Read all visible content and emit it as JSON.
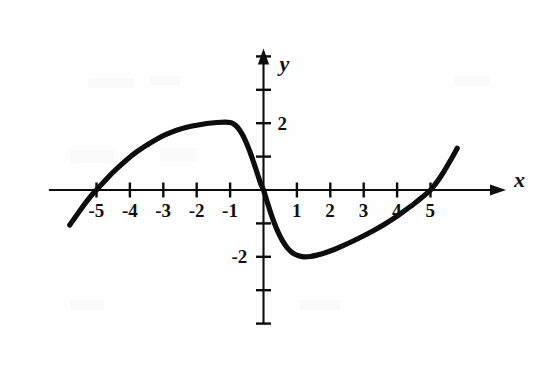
{
  "figure": {
    "background_color": "#fefefe",
    "ink_color": "#0d0d0d",
    "x_axis_label": "x",
    "y_axis_label": "y"
  },
  "chart_data": {
    "type": "line",
    "title": "",
    "subtitle": "",
    "xlabel": "x",
    "ylabel": "y",
    "xlim": [
      -6.1,
      7.2
    ],
    "ylim": [
      -4.1,
      4.3
    ],
    "grid": false,
    "legend": null,
    "axis_arrows": [
      "x-positive",
      "y-positive"
    ],
    "xticks": [
      -5,
      -4,
      -3,
      -2,
      -1,
      1,
      2,
      3,
      4,
      5
    ],
    "xtick_labels": [
      "-5",
      "-4",
      "-3",
      "-2",
      "-1",
      "1",
      "2",
      "3",
      "4",
      "5"
    ],
    "yticks": [
      -4,
      -3,
      -2,
      -1,
      1,
      2,
      3,
      4
    ],
    "ytick_labels": [
      "",
      "",
      "-2",
      "",
      "",
      "2",
      "",
      ""
    ],
    "labeled_yticks": [
      {
        "value": 2,
        "label": "2",
        "side": "right"
      },
      {
        "value": -2,
        "label": "-2",
        "side": "left"
      }
    ],
    "features": {
      "x_intercepts": [
        -5,
        0,
        5
      ],
      "local_maximum": {
        "x": -1,
        "y": 2
      },
      "local_minimum": {
        "x": 1.2,
        "y": -2
      },
      "symmetry": "odd (origin symmetric)",
      "curve_start": {
        "x": -5.8,
        "y": -1.05
      },
      "curve_end": {
        "x": 5.8,
        "y": 1.25
      }
    },
    "series": [
      {
        "name": "curve",
        "points": [
          [
            -5.8,
            -1.05
          ],
          [
            -5.5,
            -0.62
          ],
          [
            -5.2,
            -0.22
          ],
          [
            -5.0,
            0.0
          ],
          [
            -4.7,
            0.33
          ],
          [
            -4.4,
            0.63
          ],
          [
            -4.1,
            0.9
          ],
          [
            -3.8,
            1.14
          ],
          [
            -3.5,
            1.34
          ],
          [
            -3.2,
            1.52
          ],
          [
            -2.9,
            1.67
          ],
          [
            -2.6,
            1.79
          ],
          [
            -2.3,
            1.88
          ],
          [
            -2.0,
            1.94
          ],
          [
            -1.7,
            1.99
          ],
          [
            -1.4,
            2.02
          ],
          [
            -1.15,
            2.03
          ],
          [
            -1.0,
            2.02
          ],
          [
            -0.88,
            1.97
          ],
          [
            -0.78,
            1.88
          ],
          [
            -0.68,
            1.74
          ],
          [
            -0.58,
            1.56
          ],
          [
            -0.48,
            1.33
          ],
          [
            -0.38,
            1.07
          ],
          [
            -0.28,
            0.78
          ],
          [
            -0.18,
            0.48
          ],
          [
            -0.08,
            0.18
          ],
          [
            0.0,
            0.0
          ],
          [
            0.1,
            -0.32
          ],
          [
            0.2,
            -0.64
          ],
          [
            0.32,
            -0.98
          ],
          [
            0.45,
            -1.29
          ],
          [
            0.58,
            -1.54
          ],
          [
            0.72,
            -1.74
          ],
          [
            0.88,
            -1.89
          ],
          [
            1.05,
            -1.97
          ],
          [
            1.2,
            -2.0
          ],
          [
            1.4,
            -1.99
          ],
          [
            1.6,
            -1.95
          ],
          [
            1.85,
            -1.88
          ],
          [
            2.1,
            -1.79
          ],
          [
            2.4,
            -1.66
          ],
          [
            2.7,
            -1.52
          ],
          [
            3.0,
            -1.37
          ],
          [
            3.3,
            -1.21
          ],
          [
            3.6,
            -1.04
          ],
          [
            3.9,
            -0.85
          ],
          [
            4.2,
            -0.64
          ],
          [
            4.5,
            -0.42
          ],
          [
            4.75,
            -0.22
          ],
          [
            5.0,
            0.0
          ],
          [
            5.2,
            0.25
          ],
          [
            5.4,
            0.55
          ],
          [
            5.6,
            0.89
          ],
          [
            5.8,
            1.25
          ]
        ]
      }
    ]
  }
}
